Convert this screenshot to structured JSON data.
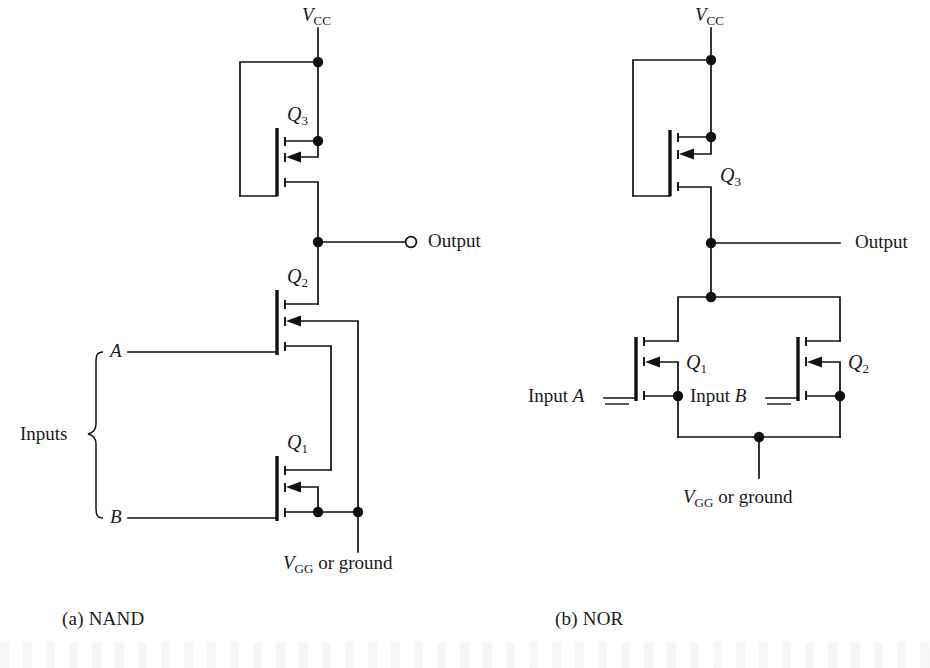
{
  "figure": {
    "background_color": "#ffffff",
    "line_color": "#111111",
    "width": 930,
    "height": 668
  },
  "captions": {
    "left": "(a) NAND",
    "right": "(b) NOR"
  },
  "nand": {
    "supply_label_v": "V",
    "supply_label_sub": "CC",
    "ground_label_v": "V",
    "ground_label_sub": "GG",
    "ground_label_rest": " or ground",
    "output_label": "Output",
    "inputs_label": "Inputs",
    "input_a": "A",
    "input_b": "B",
    "transistors": [
      {
        "id": "Q3",
        "letter": "Q",
        "sub": "3",
        "role": "load-pullup"
      },
      {
        "id": "Q2",
        "letter": "Q",
        "sub": "2",
        "role": "series-switch-input-a"
      },
      {
        "id": "Q1",
        "letter": "Q",
        "sub": "1",
        "role": "series-switch-input-b"
      }
    ],
    "topology": "series"
  },
  "nor": {
    "supply_label_v": "V",
    "supply_label_sub": "CC",
    "ground_label_v": "V",
    "ground_label_sub": "GG",
    "ground_label_rest": " or ground",
    "output_label": "Output",
    "input_a_prefix": "Input ",
    "input_a": "A",
    "input_b_prefix": "Input ",
    "input_b": "B",
    "transistors": [
      {
        "id": "Q3",
        "letter": "Q",
        "sub": "3",
        "role": "load-pullup"
      },
      {
        "id": "Q1",
        "letter": "Q",
        "sub": "1",
        "role": "parallel-switch-input-a"
      },
      {
        "id": "Q2",
        "letter": "Q",
        "sub": "2",
        "role": "parallel-switch-input-b"
      }
    ],
    "topology": "parallel"
  }
}
